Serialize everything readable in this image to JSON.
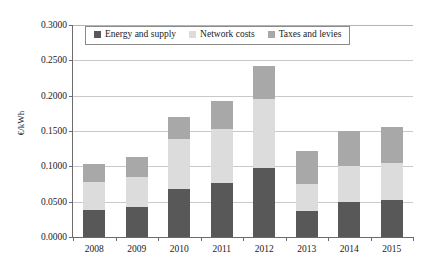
{
  "chart_data": {
    "type": "bar",
    "stacked": true,
    "title": "",
    "xlabel": "",
    "ylabel": "€/kWh",
    "categories": [
      "2008",
      "2009",
      "2010",
      "2011",
      "2012",
      "2013",
      "2014",
      "2015"
    ],
    "ylim": [
      0.0,
      0.3
    ],
    "ytick_values": [
      0.0,
      0.05,
      0.1,
      0.15,
      0.2,
      0.25,
      0.3
    ],
    "ytick_labels": [
      "0.0000",
      "0.0500",
      "0.1000",
      "0.1500",
      "0.2000",
      "0.2500",
      "0.3000"
    ],
    "grid": true,
    "legend_position": "top-center",
    "series": [
      {
        "name": "Energy and supply",
        "color": "#585858",
        "values": [
          0.0385,
          0.042,
          0.068,
          0.0765,
          0.0975,
          0.037,
          0.05,
          0.0525
        ]
      },
      {
        "name": "Network costs",
        "color": "#dcdcdc",
        "values": [
          0.039,
          0.0425,
          0.0705,
          0.0765,
          0.0985,
          0.038,
          0.0505,
          0.0525
        ]
      },
      {
        "name": "Taxes and levies",
        "color": "#a8a8a8",
        "values": [
          0.026,
          0.0285,
          0.031,
          0.04,
          0.0465,
          0.0465,
          0.0495,
          0.051
        ]
      }
    ],
    "totals": [
      0.1035,
      0.113,
      0.1695,
      0.193,
      0.2425,
      0.1215,
      0.15,
      0.156
    ]
  },
  "legend": {
    "items": [
      {
        "label": "Energy and supply",
        "color": "#585858"
      },
      {
        "label": "Network costs",
        "color": "#dcdcdc"
      },
      {
        "label": "Taxes and levies",
        "color": "#a8a8a8"
      }
    ]
  },
  "axes": {
    "y_title": "€/kWh"
  }
}
